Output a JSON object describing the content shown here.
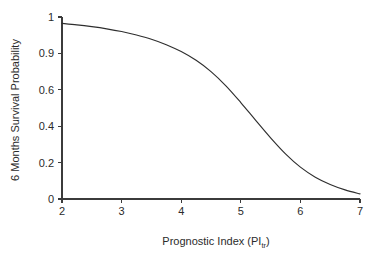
{
  "chart_data": {
    "type": "line",
    "title": "",
    "subtitle": "",
    "xlabel_prefix": "Prognostic Index (PI",
    "xlabel_subscript": "tr",
    "xlabel_suffix": ")",
    "xlabel_full": "Prognostic Index (PItr)",
    "ylabel": "6 Months Survival Probability",
    "xlim": [
      2,
      7
    ],
    "ylim": [
      0,
      1
    ],
    "grid": false,
    "legend": "none",
    "line_color": "#2e2e2e",
    "axis_color": "#3b3b3b",
    "background_color": "#ffffff",
    "xticks": [
      2,
      3,
      4,
      5,
      6,
      7
    ],
    "xtick_labels": [
      "2",
      "3",
      "4",
      "5",
      "6",
      "7"
    ],
    "yticks": [
      0,
      0.2,
      0.4,
      0.6,
      0.9,
      1
    ],
    "ytick_labels": [
      "0",
      "0.2",
      "0.4",
      "0.6",
      "0.9",
      "1"
    ],
    "ytick_positions": [
      0,
      0.2,
      0.4,
      0.6,
      0.8,
      1
    ],
    "series": [
      {
        "name": "6 month survival probability",
        "x": [
          2.0,
          2.25,
          2.5,
          2.75,
          3.0,
          3.25,
          3.5,
          3.75,
          4.0,
          4.25,
          4.5,
          4.75,
          5.0,
          5.25,
          5.5,
          5.75,
          6.0,
          6.25,
          6.5,
          6.75,
          7.0
        ],
        "values": [
          0.965,
          0.957,
          0.947,
          0.935,
          0.92,
          0.901,
          0.878,
          0.848,
          0.81,
          0.762,
          0.7,
          0.622,
          0.53,
          0.432,
          0.336,
          0.248,
          0.175,
          0.12,
          0.08,
          0.05,
          0.028
        ]
      }
    ],
    "annotations": []
  },
  "figure": {
    "name": "survival-probability-figure"
  }
}
